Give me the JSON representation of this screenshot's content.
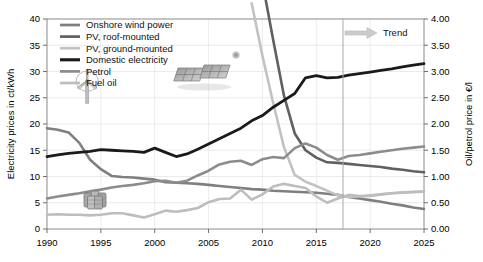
{
  "chart_data": {
    "type": "line",
    "title": "",
    "xlabel": "",
    "ylabel": "Electricity prices in ct/kWh",
    "y2label": "Oil/petrol price in €/l",
    "xlim": [
      1990,
      2025
    ],
    "ylim": [
      0,
      40
    ],
    "y2lim": [
      0.0,
      4.0
    ],
    "grid": true,
    "legend_position": "top-left",
    "xticks": [
      "1990",
      "1995",
      "2000",
      "2005",
      "2010",
      "2015",
      "2020",
      "2025"
    ],
    "xtick_values": [
      1990,
      1995,
      2000,
      2005,
      2010,
      2015,
      2020,
      2025
    ],
    "yticks": [
      "0",
      "5",
      "10",
      "15",
      "20",
      "25",
      "30",
      "35",
      "40"
    ],
    "ytick_values": [
      0,
      5,
      10,
      15,
      20,
      25,
      30,
      35,
      40
    ],
    "y2ticks": [
      "0.00",
      "0.50",
      "1.00",
      "1.50",
      "2.00",
      "2.50",
      "3.00",
      "3.50",
      "4.00"
    ],
    "y2tick_values": [
      0.0,
      0.5,
      1.0,
      1.5,
      2.0,
      2.5,
      3.0,
      3.5,
      4.0
    ],
    "annotations": [
      {
        "name": "trend-divider",
        "type": "vline",
        "x": 2017.5
      },
      {
        "name": "trend-arrow",
        "type": "arrow",
        "label": "Trend",
        "x": 2017.3,
        "y": 38.2
      }
    ],
    "x": [
      1990,
      1991,
      1992,
      1993,
      1994,
      1995,
      1996,
      1997,
      1998,
      1999,
      2000,
      2001,
      2002,
      2003,
      2004,
      2005,
      2006,
      2007,
      2008,
      2009,
      2010,
      2011,
      2012,
      2013,
      2014,
      2015,
      2016,
      2017,
      2018,
      2019,
      2020,
      2021,
      2022,
      2023,
      2024,
      2025
    ],
    "series": [
      {
        "name": "Onshore wind power",
        "color": "#7f7f7f",
        "width": 2.6,
        "axis": "left",
        "values": [
          19.2,
          18.9,
          18.4,
          16.4,
          13.2,
          11.4,
          10.1,
          9.9,
          9.8,
          9.6,
          9.4,
          8.9,
          8.8,
          8.7,
          8.6,
          8.4,
          8.2,
          8.0,
          7.8,
          7.6,
          7.5,
          7.3,
          7.2,
          7.1,
          7.0,
          6.9,
          6.7,
          6.5,
          6.1,
          5.8,
          5.5,
          5.2,
          4.8,
          4.5,
          4.1,
          3.8
        ]
      },
      {
        "name": "PV, roof-mounted",
        "color": "#606060",
        "width": 2.6,
        "axis": "left",
        "values": [
          null,
          null,
          null,
          null,
          null,
          null,
          null,
          null,
          null,
          null,
          null,
          null,
          null,
          null,
          null,
          null,
          null,
          null,
          null,
          56.0,
          47.0,
          36.0,
          25.4,
          18.2,
          15.0,
          13.6,
          12.7,
          12.6,
          12.4,
          12.2,
          12.0,
          11.8,
          11.5,
          11.3,
          11.0,
          10.8
        ]
      },
      {
        "name": "PV, ground-mounted",
        "color": "#c2c2c2",
        "width": 2.6,
        "axis": "left",
        "values": [
          null,
          null,
          null,
          null,
          null,
          null,
          null,
          null,
          null,
          null,
          null,
          null,
          null,
          null,
          null,
          null,
          null,
          null,
          null,
          43.0,
          33.0,
          24.0,
          15.6,
          10.3,
          9.0,
          8.2,
          7.3,
          6.4,
          6.1,
          6.2,
          6.4,
          6.6,
          6.8,
          7.0,
          7.1,
          7.2
        ]
      },
      {
        "name": "Domestic electricity",
        "color": "#1a1a1a",
        "width": 2.8,
        "axis": "left",
        "values": [
          13.8,
          14.1,
          14.4,
          14.6,
          14.8,
          15.1,
          15.0,
          14.9,
          14.8,
          14.6,
          15.4,
          14.6,
          13.8,
          14.3,
          15.2,
          16.2,
          17.2,
          18.2,
          19.2,
          20.6,
          21.6,
          23.2,
          24.5,
          25.8,
          28.8,
          29.2,
          28.8,
          28.9,
          29.3,
          29.6,
          29.9,
          30.2,
          30.5,
          30.9,
          31.2,
          31.5
        ]
      },
      {
        "name": "Petrol",
        "color": "#8c8c8c",
        "width": 2.6,
        "axis": "right",
        "values": [
          0.58,
          0.62,
          0.65,
          0.68,
          0.72,
          0.75,
          0.79,
          0.82,
          0.84,
          0.87,
          0.91,
          0.92,
          0.88,
          0.92,
          1.02,
          1.11,
          1.23,
          1.28,
          1.3,
          1.22,
          1.33,
          1.37,
          1.35,
          1.54,
          1.63,
          1.55,
          1.41,
          1.32,
          1.39,
          1.41,
          1.44,
          1.47,
          1.5,
          1.53,
          1.55,
          1.57
        ]
      },
      {
        "name": "Fuel oil",
        "color": "#bdbdbd",
        "width": 2.6,
        "axis": "right",
        "values": [
          0.27,
          0.28,
          0.27,
          0.27,
          0.26,
          0.27,
          0.3,
          0.3,
          0.26,
          0.22,
          0.28,
          0.35,
          0.33,
          0.36,
          0.4,
          0.51,
          0.57,
          0.58,
          0.75,
          0.56,
          0.66,
          0.81,
          0.86,
          0.82,
          0.78,
          0.62,
          0.5,
          0.58,
          0.65,
          0.63,
          0.63,
          0.66,
          0.68,
          0.69,
          0.7,
          0.71
        ]
      }
    ]
  },
  "legend": {
    "items": [
      {
        "label": "Onshore wind power",
        "color": "#7f7f7f"
      },
      {
        "label": "PV, roof-mounted",
        "color": "#606060"
      },
      {
        "label": "PV, ground-mounted",
        "color": "#c2c2c2"
      },
      {
        "label": "Domestic electricity",
        "color": "#1a1a1a"
      },
      {
        "label": "Petrol",
        "color": "#8c8c8c"
      },
      {
        "label": "Fuel oil",
        "color": "#bdbdbd"
      }
    ]
  },
  "trend": {
    "label": "Trend",
    "arrow_color": "#c9c9c9"
  },
  "illustrations": [
    {
      "name": "wind-turbine-illustration"
    },
    {
      "name": "oil-barrels-illustration"
    },
    {
      "name": "solar-panels-illustration"
    },
    {
      "name": "sun-dot-illustration"
    }
  ],
  "axes": {
    "left_title": "Electricity prices in ct/kWh",
    "right_title": "Oil/petrol price in €/l"
  }
}
